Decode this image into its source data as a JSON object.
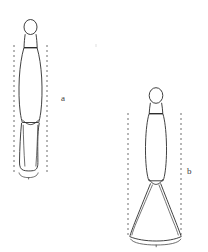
{
  "figure": {
    "background_color": "#ffffff",
    "stroke_color": "#2b2b2b",
    "dash_color": "#6e6e6e",
    "width": 208,
    "height": 252,
    "items": [
      {
        "id": "a",
        "label": "a",
        "label_x": 61,
        "label_y": 94,
        "description": "Slender elongated profile: small round knob at top, short tapered collar, long narrow ovoid body, inner V-shaped constriction low on the body, flat rounded base flanked by dashed vertical guide lines",
        "outline_points": "29,20 33,21 36,24 37,28 36,32 34,35 36,36 38,41 39,48 42,58 44,72 45,92 44,108 42,118 40,124 39,140 38,158 37,166 34,170 27,171 21,170 19,166 19,155 19,140 20,124 19,118 17,108 16,92 17,72 19,58 22,48 23,41 25,36 27,35 25,32 24,28 25,24 28,21",
        "guide_left_x": 14,
        "guide_right_x": 47,
        "guide_top_y": 45,
        "guide_bottom_y": 172,
        "bracket_y": 174,
        "bracket_left_x": 18,
        "bracket_right_x": 39
      },
      {
        "id": "b",
        "label": "b",
        "label_x": 187,
        "label_y": 167,
        "description": "Profile with small round knob at top, short collar, elongated ovoid body, pinched waist, and a broad flaring triangular skirt with a curved base spanned by a bracket",
        "outline_points": "154,88 158,89 161,92 162,96 161,100 159,103 161,104 163,109 164,116 166,126 167,140 167,156 166,168 164,176 162,181 165,186 172,204 180,224 186,236 176,240 166,242 156,243 146,242 136,240 126,236 132,224 140,204 147,186 150,181 148,176 146,168 145,156 145,140 146,126 148,116 149,109 151,104 153,103 151,100 150,96 151,92",
        "guide_left_x": 128,
        "guide_right_x": 181,
        "guide_top_y": 113,
        "guide_bottom_y": 238,
        "bracket_y": 241,
        "bracket_left_x": 130,
        "bracket_right_x": 183
      }
    ]
  }
}
